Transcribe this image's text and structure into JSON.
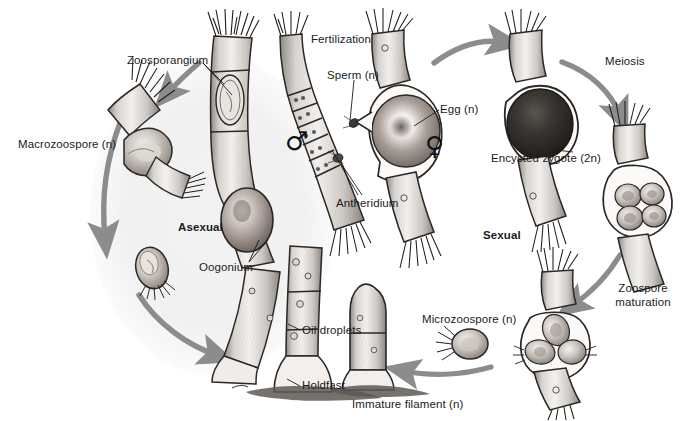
{
  "diagram": {
    "background_color": "#ffffff",
    "ink_color": "#222222",
    "arrow_color": "#8c8c8c",
    "tint_color": "#f0f0f0"
  },
  "phase_labels": [
    {
      "id": "asexual",
      "text": "Asexual",
      "x": 178,
      "y": 221,
      "bold": true
    },
    {
      "id": "sexual",
      "text": "Sexual",
      "x": 483,
      "y": 229,
      "bold": true
    }
  ],
  "labels": [
    {
      "id": "macrozoospore",
      "text": "Macrozoospore (n)",
      "x": 18,
      "y": 138
    },
    {
      "id": "zoosporangium",
      "text": "Zoosporangium",
      "x": 127,
      "y": 54
    },
    {
      "id": "oogonium",
      "text": "Oogonium",
      "x": 199,
      "y": 261
    },
    {
      "id": "oil-droplets",
      "text": "Oil droplets",
      "x": 302,
      "y": 324
    },
    {
      "id": "holdfast",
      "text": "Holdfast",
      "x": 302,
      "y": 379
    },
    {
      "id": "fertilization",
      "text": "Fertilization",
      "x": 311,
      "y": 33
    },
    {
      "id": "sperm",
      "text": "Sperm (n)",
      "x": 327,
      "y": 69
    },
    {
      "id": "antheridium",
      "text": "Antheridium",
      "x": 336,
      "y": 197
    },
    {
      "id": "egg",
      "text": "Egg (n)",
      "x": 440,
      "y": 103
    },
    {
      "id": "encysted-zygote",
      "text": "Encysted zygote (2n)",
      "x": 491,
      "y": 152
    },
    {
      "id": "meiosis",
      "text": "Meiosis",
      "x": 605,
      "y": 55
    },
    {
      "id": "microzoospore",
      "text": "Microzoospore (n)",
      "x": 422,
      "y": 313
    },
    {
      "id": "immature-filament",
      "text": "Immature filament (n)",
      "x": 352,
      "y": 398
    }
  ],
  "multiline_labels": [
    {
      "id": "zoospore-maturation",
      "line1": "Zoospore",
      "line2": "maturation",
      "x": 610,
      "y": 282,
      "width": 66
    }
  ],
  "gender_symbols": [
    {
      "id": "male-symbol",
      "glyph": "♂",
      "x": 285,
      "y": 128,
      "size": 26
    },
    {
      "id": "female-symbol",
      "glyph": "♀",
      "x": 425,
      "y": 133,
      "size": 26
    }
  ],
  "structures": [
    {
      "id": "zoosporangium-filament",
      "name": "Zoosporangium filament"
    },
    {
      "id": "macrozoospore-release",
      "name": "Macrozoospore releasing filament"
    },
    {
      "id": "free-macrozoospore",
      "name": "Free swimming macrozoospore"
    },
    {
      "id": "antheridium-filament",
      "name": "Male filament with antheridia"
    },
    {
      "id": "oogonium-filament",
      "name": "Female filament with oogonium and egg"
    },
    {
      "id": "main-thallus",
      "name": "Main thallus with holdfast and oil droplets"
    },
    {
      "id": "encysted-zygote-body",
      "name": "Encysted zygote on filament"
    },
    {
      "id": "meiosis-sporangium",
      "name": "Sporangium with four meiotic products"
    },
    {
      "id": "zoospore-release-body",
      "name": "Sporangium releasing microzoospores"
    },
    {
      "id": "free-microzoospore",
      "name": "Free swimming microzoospore"
    },
    {
      "id": "immature-filament-body",
      "name": "Immature filament anchored by holdfast"
    }
  ],
  "arrows": [
    {
      "id": "arrow-sporangium-to-release",
      "from": "zoosporangium-filament",
      "to": "macrozoospore-release"
    },
    {
      "id": "arrow-asexual-left-arc",
      "from": "macrozoospore-release",
      "to": "free-macrozoospore"
    },
    {
      "id": "arrow-asexual-bottom-arc",
      "from": "free-macrozoospore",
      "to": "main-thallus"
    },
    {
      "id": "arrow-fertilization-to-zygote",
      "from": "oogonium-filament",
      "to": "encysted-zygote-body"
    },
    {
      "id": "arrow-meiosis",
      "from": "encysted-zygote-body",
      "to": "meiosis-sporangium"
    },
    {
      "id": "arrow-zoospore-maturation",
      "from": "meiosis-sporangium",
      "to": "zoospore-release-body"
    },
    {
      "id": "arrow-to-immature-filament",
      "from": "zoospore-release-body",
      "to": "immature-filament-body"
    }
  ],
  "leader_lines": [
    {
      "id": "leader-zoosporangium-a",
      "label": "zoosporangium"
    },
    {
      "id": "leader-zoosporangium-b",
      "label": "zoosporangium"
    },
    {
      "id": "leader-oogonium-a",
      "label": "oogonium"
    },
    {
      "id": "leader-oogonium-b",
      "label": "oogonium"
    },
    {
      "id": "leader-oil-droplets",
      "label": "oil-droplets"
    },
    {
      "id": "leader-holdfast",
      "label": "holdfast"
    },
    {
      "id": "leader-sperm",
      "label": "sperm"
    },
    {
      "id": "leader-antheridium-a",
      "label": "antheridium"
    },
    {
      "id": "leader-antheridium-b",
      "label": "antheridium"
    },
    {
      "id": "leader-egg",
      "label": "egg"
    },
    {
      "id": "leader-zygote",
      "label": "encysted-zygote"
    }
  ]
}
